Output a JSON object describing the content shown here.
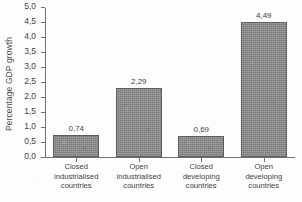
{
  "chart_data": {
    "type": "bar",
    "title": "",
    "subtitle": "",
    "xlabel": "",
    "ylabel": "Percentage GDP growth",
    "categories": [
      "Closed\nindustrialised\ncountries",
      "Open\nindustrialised\ncountries",
      "Closed\ndeveloping\ncountries",
      "Open\ndeveloping\ncountries"
    ],
    "values": [
      0.74,
      2.29,
      0.69,
      4.49
    ],
    "value_labels": [
      "0,74",
      "2,29",
      "0,69",
      "4,49"
    ],
    "ylim": [
      0.0,
      5.0
    ],
    "ytick_values": [
      0.0,
      0.5,
      1.0,
      1.5,
      2.0,
      2.5,
      3.0,
      3.5,
      4.0,
      4.5,
      5.0
    ],
    "ytick_labels": [
      "0,0",
      "0,5",
      "1,0",
      "1,5",
      "2,0",
      "2,5",
      "3,0",
      "3,5",
      "4,0",
      "4,5",
      "5,0"
    ],
    "grid": false,
    "legend": false,
    "legend_position": "none",
    "decimal_separator": ",",
    "bar_color": "#8b8b8b",
    "bar_border_color": "#5d5d5d",
    "axis_color": "#6f6f6f",
    "text_color": "#3f3f3f",
    "background_color": "#fdfdfd"
  }
}
